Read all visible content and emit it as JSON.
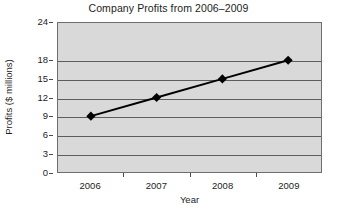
{
  "chart_data": {
    "type": "line",
    "title": "Company Profits from 2006–2009",
    "xlabel": "Year",
    "ylabel": "Profits ($ millions)",
    "categories": [
      "2006",
      "2007",
      "2008",
      "2009"
    ],
    "values": [
      9,
      12,
      15,
      18
    ],
    "series": [
      {
        "name": "Profits",
        "values": [
          9,
          12,
          15,
          18
        ]
      }
    ],
    "ylim": [
      0,
      24
    ],
    "yticks": [
      0,
      3,
      6,
      9,
      12,
      15,
      18,
      24
    ],
    "ytick_labels": [
      "0",
      "3",
      "6",
      "9",
      "12",
      "15",
      "18",
      "24"
    ],
    "gridlines": true,
    "grid_axis": "y",
    "legend": false,
    "legend_position": "none",
    "marker": "diamond",
    "marker_color": "#000000",
    "line_color": "#000000",
    "plot_background": "#d9d9d9",
    "figure_background": "#ffffff",
    "grid_color": "#5d5d5d",
    "axis_color": "#6e6e6e",
    "points": [
      {
        "x": "2006",
        "y": 9
      },
      {
        "x": "2007",
        "y": 12
      },
      {
        "x": "2008",
        "y": 15
      },
      {
        "x": "2009",
        "y": 18
      }
    ]
  }
}
